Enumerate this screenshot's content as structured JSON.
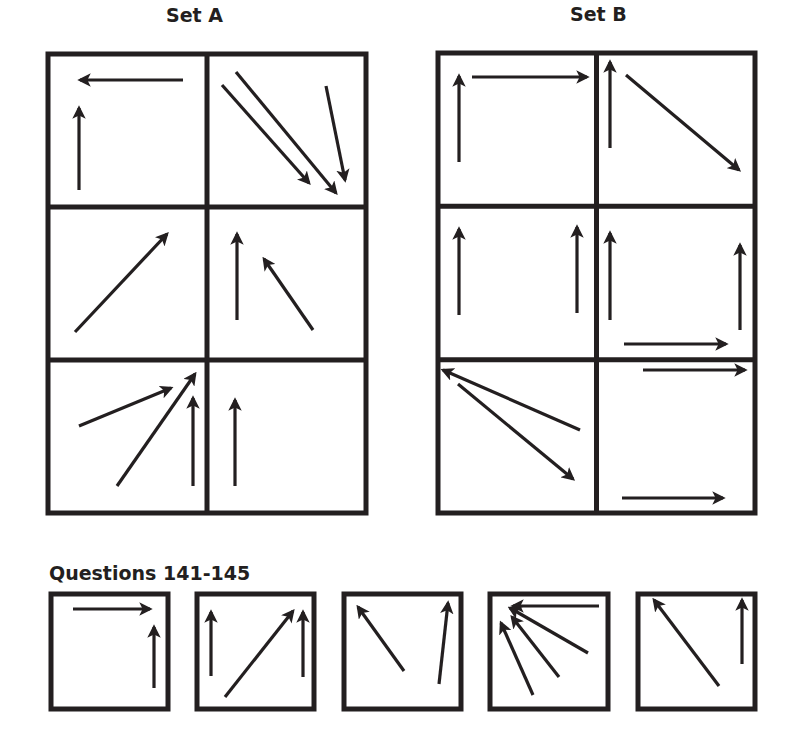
{
  "set_a": {
    "title": "Set A",
    "frame": {
      "x": 48,
      "y": 54,
      "w": 318,
      "h": 459
    },
    "cells": [
      {
        "name": "a-r1c1",
        "arrows": [
          [
            183,
            80,
            80,
            80
          ],
          [
            79,
            190,
            79,
            108
          ]
        ]
      },
      {
        "name": "a-r1c2",
        "arrows": [
          [
            222,
            85,
            309,
            183
          ],
          [
            236,
            72,
            336,
            193
          ],
          [
            326,
            86,
            345,
            180
          ]
        ]
      },
      {
        "name": "a-r2c1",
        "arrows": [
          [
            75,
            332,
            167,
            234
          ]
        ]
      },
      {
        "name": "a-r2c2",
        "arrows": [
          [
            237,
            320,
            237,
            234
          ],
          [
            313,
            330,
            264,
            259
          ]
        ]
      },
      {
        "name": "a-r3c1",
        "arrows": [
          [
            79,
            426,
            171,
            388
          ],
          [
            117,
            486,
            195,
            374
          ],
          [
            193,
            486,
            193,
            398
          ]
        ]
      },
      {
        "name": "a-r3c2",
        "arrows": [
          [
            235,
            486,
            235,
            400
          ]
        ]
      }
    ]
  },
  "set_b": {
    "title": "Set B",
    "frame": {
      "x": 438,
      "y": 53,
      "w": 317,
      "h": 460
    },
    "cells": [
      {
        "name": "b-r1c1",
        "arrows": [
          [
            459,
            162,
            459,
            76
          ],
          [
            472,
            77,
            587,
            77
          ]
        ]
      },
      {
        "name": "b-r1c2",
        "arrows": [
          [
            610,
            148,
            610,
            62
          ],
          [
            626,
            75,
            739,
            170
          ]
        ]
      },
      {
        "name": "b-r2c1",
        "arrows": [
          [
            459,
            315,
            459,
            229
          ],
          [
            577,
            313,
            577,
            227
          ]
        ]
      },
      {
        "name": "b-r2c2",
        "arrows": [
          [
            610,
            320,
            610,
            233
          ],
          [
            740,
            330,
            740,
            245
          ],
          [
            624,
            344,
            726,
            344
          ]
        ]
      },
      {
        "name": "b-r3c1",
        "arrows": [
          [
            580,
            430,
            443,
            370
          ],
          [
            458,
            384,
            573,
            479
          ]
        ]
      },
      {
        "name": "b-r3c2",
        "arrows": [
          [
            643,
            370,
            745,
            370
          ],
          [
            622,
            498,
            723,
            498
          ]
        ]
      }
    ]
  },
  "questions": {
    "title": "Questions 141-145",
    "boxes": [
      {
        "name": "question-141",
        "frame": {
          "x": 51,
          "y": 594,
          "w": 117,
          "h": 115
        },
        "arrows": [
          [
            73,
            609,
            150,
            609
          ],
          [
            154,
            688,
            154,
            627
          ]
        ]
      },
      {
        "name": "question-142",
        "frame": {
          "x": 197,
          "y": 594,
          "w": 117,
          "h": 115
        },
        "arrows": [
          [
            211,
            676,
            211,
            612
          ],
          [
            225,
            697,
            293,
            611
          ],
          [
            303,
            677,
            303,
            612
          ]
        ]
      },
      {
        "name": "question-143",
        "frame": {
          "x": 344,
          "y": 594,
          "w": 117,
          "h": 115
        },
        "arrows": [
          [
            404,
            671,
            358,
            607
          ],
          [
            439,
            684,
            448,
            603
          ]
        ]
      },
      {
        "name": "question-144",
        "frame": {
          "x": 490,
          "y": 594,
          "w": 118,
          "h": 115
        },
        "arrows": [
          [
            599,
            606,
            513,
            606
          ],
          [
            588,
            653,
            510,
            608
          ],
          [
            559,
            677,
            512,
            617
          ],
          [
            533,
            695,
            501,
            623
          ]
        ]
      },
      {
        "name": "question-145",
        "frame": {
          "x": 638,
          "y": 594,
          "w": 117,
          "h": 115
        },
        "arrows": [
          [
            719,
            686,
            654,
            600
          ],
          [
            742,
            664,
            742,
            600
          ]
        ]
      }
    ]
  },
  "colors": {
    "stroke": "#231f20",
    "background": "#ffffff"
  }
}
